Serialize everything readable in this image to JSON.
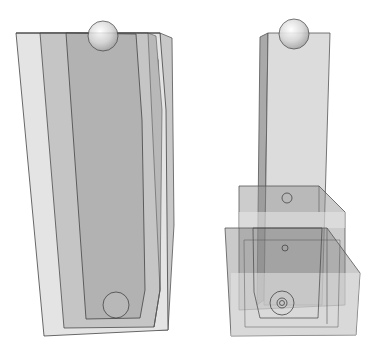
{
  "figure": {
    "left_object": {
      "label": "",
      "parts": [
        "outer-shell",
        "middle-shell",
        "inner-cavity",
        "top-sphere",
        "bottom-sphere"
      ]
    },
    "right_object": {
      "label": "",
      "parts": [
        "tall-column",
        "top-sphere",
        "upper-box",
        "lower-box",
        "small-hole-upper",
        "small-hole-middle",
        "concentric-rings-bottom"
      ]
    },
    "colors": {
      "background": "#ffffff",
      "light_gray": "#e2e2e2",
      "mid_gray": "#bdbdbd",
      "dark_gray": "#9a9a9a",
      "outline": "#444444"
    }
  }
}
